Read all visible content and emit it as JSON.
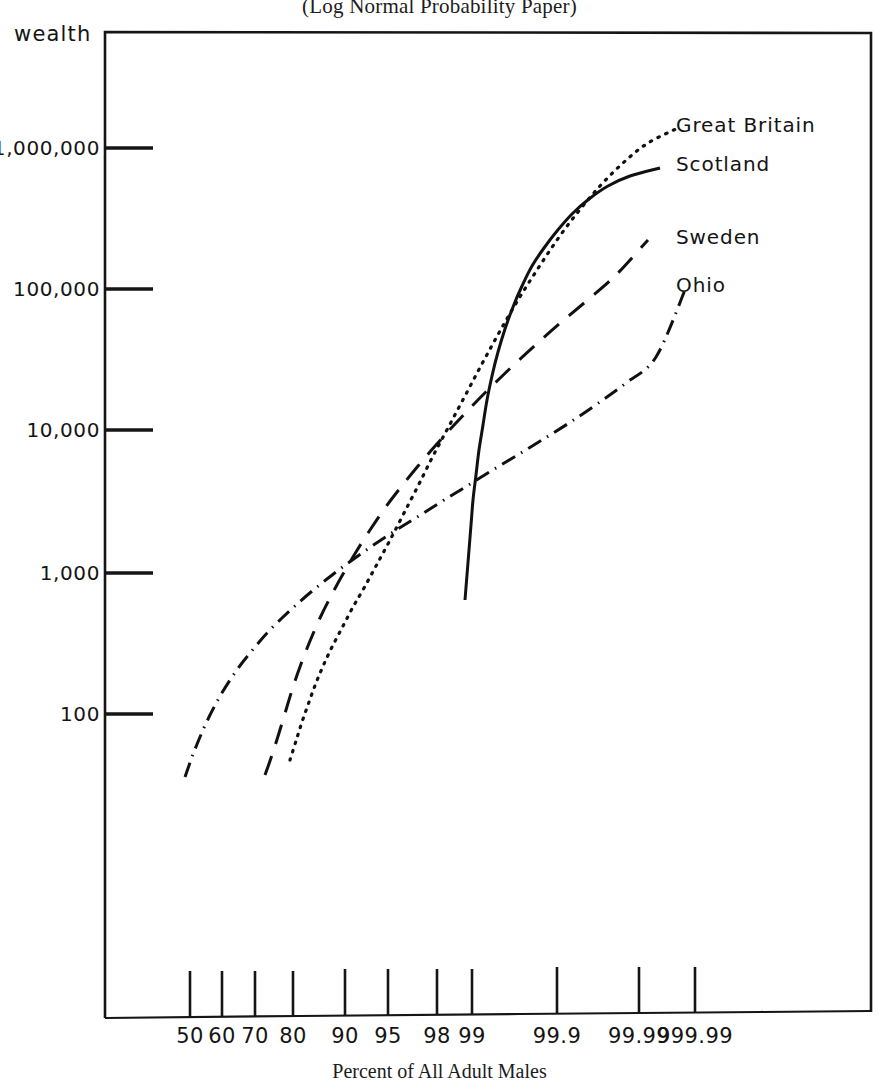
{
  "chart_data": {
    "type": "line",
    "title": "(Log Normal Probability Paper)",
    "subtitle": "",
    "xlabel": "Percent of All Adult Males",
    "ylabel": "wealth",
    "grid": false,
    "legend_position": "right-inline",
    "scale": {
      "x": "normal-probability",
      "y": "log10"
    },
    "x_ticks": [
      {
        "label": "50",
        "px": 190
      },
      {
        "label": "60",
        "px": 222
      },
      {
        "label": "70",
        "px": 255
      },
      {
        "label": "80",
        "px": 293
      },
      {
        "label": "90",
        "px": 345
      },
      {
        "label": "95",
        "px": 388
      },
      {
        "label": "98",
        "px": 437
      },
      {
        "label": "99",
        "px": 472
      },
      {
        "label": "99.9",
        "px": 557
      },
      {
        "label": "99.99",
        "px": 639
      },
      {
        "label": "999.99",
        "px": 695
      }
    ],
    "y_ticks": [
      {
        "label": "1,000,000",
        "value": 1000000,
        "px": 148
      },
      {
        "label": "100,000",
        "value": 100000,
        "px": 289
      },
      {
        "label": "10,000",
        "value": 10000,
        "px": 430
      },
      {
        "label": "1,000",
        "value": 1000,
        "px": 573
      },
      {
        "label": "100",
        "value": 100,
        "px": 714
      }
    ],
    "ylim": [
      20,
      6000000
    ],
    "series": [
      {
        "name": "Great Britain",
        "style": "dotted",
        "label_x": 676,
        "label_y": 113,
        "points": [
          [
            290,
            760
          ],
          [
            296,
            741
          ],
          [
            302,
            722
          ],
          [
            309,
            702
          ],
          [
            316,
            683
          ],
          [
            324,
            664
          ],
          [
            333,
            645
          ],
          [
            343,
            626
          ],
          [
            353,
            607
          ],
          [
            364,
            588
          ],
          [
            376,
            566
          ],
          [
            389,
            542
          ],
          [
            403,
            515
          ],
          [
            418,
            486
          ],
          [
            433,
            456
          ],
          [
            449,
            426
          ],
          [
            466,
            394
          ],
          [
            483,
            362
          ],
          [
            500,
            331
          ],
          [
            518,
            300
          ],
          [
            537,
            270
          ],
          [
            557,
            240
          ],
          [
            578,
            212
          ],
          [
            600,
            186
          ],
          [
            623,
            163
          ],
          [
            648,
            143
          ],
          [
            678,
            128
          ]
        ]
      },
      {
        "name": "Scotland",
        "style": "solid",
        "label_x": 676,
        "label_y": 152,
        "points": [
          [
            465,
            600
          ],
          [
            467,
            575
          ],
          [
            469,
            550
          ],
          [
            471,
            525
          ],
          [
            473,
            500
          ],
          [
            476,
            475
          ],
          [
            479,
            450
          ],
          [
            483,
            425
          ],
          [
            487,
            400
          ],
          [
            492,
            376
          ],
          [
            498,
            352
          ],
          [
            505,
            329
          ],
          [
            513,
            307
          ],
          [
            522,
            286
          ],
          [
            532,
            266
          ],
          [
            544,
            248
          ],
          [
            557,
            231
          ],
          [
            572,
            214
          ],
          [
            589,
            199
          ],
          [
            608,
            186
          ],
          [
            630,
            176
          ],
          [
            660,
            168
          ]
        ]
      },
      {
        "name": "Sweden",
        "style": "dashed",
        "label_x": 676,
        "label_y": 225,
        "points": [
          [
            265,
            775
          ],
          [
            272,
            755
          ],
          [
            279,
            733
          ],
          [
            286,
            710
          ],
          [
            293,
            687
          ],
          [
            301,
            664
          ],
          [
            310,
            641
          ],
          [
            320,
            618
          ],
          [
            331,
            596
          ],
          [
            343,
            574
          ],
          [
            356,
            552
          ],
          [
            370,
            530
          ],
          [
            385,
            508
          ],
          [
            401,
            487
          ],
          [
            418,
            466
          ],
          [
            436,
            445
          ],
          [
            455,
            424
          ],
          [
            475,
            403
          ],
          [
            496,
            382
          ],
          [
            518,
            361
          ],
          [
            541,
            340
          ],
          [
            565,
            319
          ],
          [
            590,
            298
          ],
          [
            616,
            275
          ],
          [
            648,
            240
          ]
        ]
      },
      {
        "name": "Ohio",
        "style": "dash-dot",
        "label_x": 676,
        "label_y": 273,
        "points": [
          [
            185,
            777
          ],
          [
            192,
            757
          ],
          [
            200,
            737
          ],
          [
            209,
            717
          ],
          [
            219,
            698
          ],
          [
            230,
            680
          ],
          [
            242,
            663
          ],
          [
            255,
            647
          ],
          [
            268,
            632
          ],
          [
            282,
            618
          ],
          [
            296,
            605
          ],
          [
            311,
            592
          ],
          [
            327,
            579
          ],
          [
            344,
            566
          ],
          [
            362,
            553
          ],
          [
            381,
            540
          ],
          [
            401,
            527
          ],
          [
            422,
            514
          ],
          [
            444,
            500
          ],
          [
            467,
            486
          ],
          [
            491,
            471
          ],
          [
            516,
            456
          ],
          [
            542,
            440
          ],
          [
            569,
            423
          ],
          [
            597,
            404
          ],
          [
            626,
            383
          ],
          [
            656,
            357
          ],
          [
            685,
            290
          ]
        ]
      }
    ],
    "plot_frame": {
      "left": 105,
      "top": 32,
      "right": 871,
      "bottom": 1018
    }
  }
}
